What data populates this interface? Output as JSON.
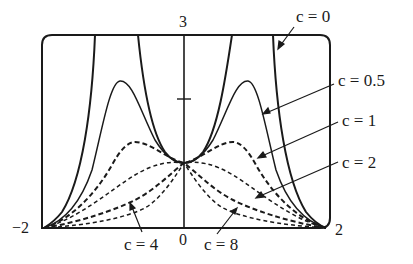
{
  "figure": {
    "type": "family of curves",
    "axes": {
      "x_range": [
        -2,
        2
      ],
      "y_range": [
        0,
        3
      ],
      "x_tick_labels": [
        "-2",
        "0",
        "2"
      ],
      "y_tick_labels": [
        "3"
      ],
      "y_minor_tick": 2
    },
    "labels": {
      "c0": "c = 0",
      "c05": "c = 0.5",
      "c1": "c = 1",
      "c2": "c = 2",
      "c4": "c = 4",
      "c8": "c = 8"
    },
    "ticks": {
      "xmin": "−2",
      "x0": "0",
      "xmax": "2",
      "ymax": "3"
    },
    "curves": [
      {
        "c": "0",
        "style": "solid"
      },
      {
        "c": "0.5",
        "style": "solid"
      },
      {
        "c": "1",
        "style": "dashed"
      },
      {
        "c": "2",
        "style": "dashed"
      },
      {
        "c": "4",
        "style": "dashed"
      },
      {
        "c": "8",
        "style": "dashed"
      }
    ],
    "colors": {
      "line": "#1a1a1a",
      "background": "#ffffff"
    }
  }
}
